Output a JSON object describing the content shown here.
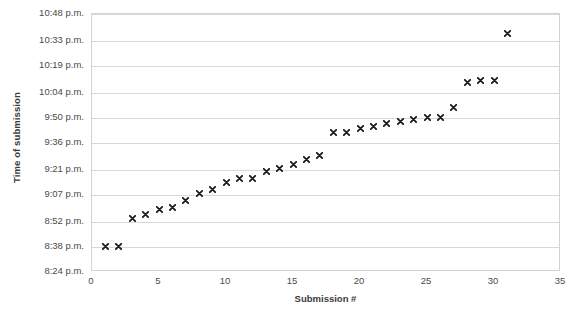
{
  "chart_data": {
    "type": "scatter",
    "title": "",
    "xlabel": "Submission #",
    "ylabel": "Time of submission",
    "xlim": [
      0,
      35
    ],
    "ylim": [
      "8:24 p.m.",
      "10:48 p.m."
    ],
    "grid": true,
    "legend": "none",
    "marker": "x",
    "marker_color": "#1a1a1a",
    "x_ticks": [
      "0",
      "5",
      "10",
      "15",
      "20",
      "25",
      "30",
      "35"
    ],
    "x_tick_values": [
      0,
      5,
      10,
      15,
      20,
      25,
      30,
      35
    ],
    "y_ticks": [
      "10:48 p.m.",
      "10:33 p.m.",
      "10:19 p.m.",
      "10:04 p.m.",
      "9:50 p.m.",
      "9:36 p.m.",
      "9:21 p.m.",
      "9:07 p.m.",
      "8:52 p.m.",
      "8:38 p.m.",
      "8:24 p.m."
    ],
    "y_tick_minutes": [
      1248,
      1233,
      1219,
      1204,
      1190,
      1176,
      1161,
      1147,
      1132,
      1118,
      1104
    ],
    "x": [
      1,
      2,
      3,
      4,
      5,
      6,
      7,
      8,
      9,
      10,
      11,
      12,
      13,
      14,
      15,
      16,
      17,
      18,
      19,
      20,
      21,
      22,
      23,
      24,
      25,
      26,
      27,
      28,
      29,
      30,
      31
    ],
    "y_labels": [
      "8:38 p.m.",
      "8:38 p.m.",
      "8:54 p.m.",
      "8:56 p.m.",
      "8:59 p.m.",
      "9:00 p.m.",
      "9:04 p.m.",
      "9:08 p.m.",
      "9:10 p.m.",
      "9:14 p.m.",
      "9:16 p.m.",
      "9:16 p.m.",
      "9:20 p.m.",
      "9:22 p.m.",
      "9:24 p.m.",
      "9:27 p.m.",
      "9:29 p.m.",
      "9:42 p.m.",
      "9:42 p.m.",
      "9:44 p.m.",
      "9:45 p.m.",
      "9:47 p.m.",
      "9:48 p.m.",
      "9:49 p.m.",
      "9:50 p.m.",
      "9:50 p.m.",
      "9:56 p.m.",
      "10:10 p.m.",
      "10:11 p.m.",
      "10:11 p.m.",
      "10:37 p.m."
    ],
    "y_minutes": [
      1118,
      1118,
      1134,
      1136,
      1139,
      1140,
      1144,
      1148,
      1150,
      1154,
      1156,
      1156,
      1160,
      1162,
      1164,
      1167,
      1169,
      1182,
      1182,
      1184,
      1185,
      1187,
      1188,
      1189,
      1190,
      1190,
      1196,
      1210,
      1211,
      1211,
      1237
    ]
  }
}
